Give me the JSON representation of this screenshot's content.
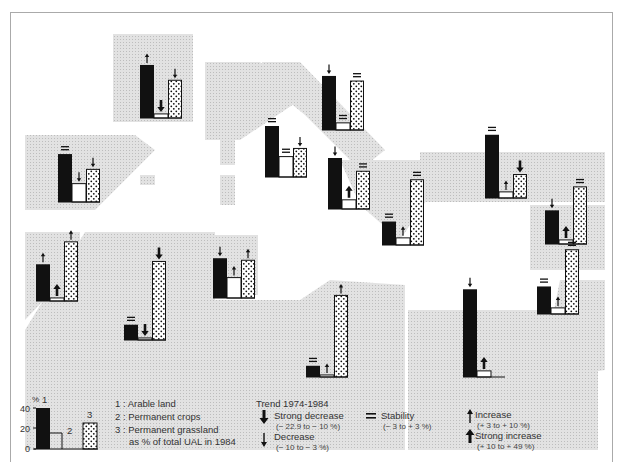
{
  "chart_data": {
    "type": "bar",
    "ylabel": "%",
    "ylim": [
      0,
      45
    ],
    "series_names": [
      "Arable land",
      "Permanent crops",
      "Permanent grassland"
    ],
    "groups": [
      {
        "x": 140,
        "base": 118,
        "values": [
          52,
          4,
          37
        ],
        "trends": [
          "increase",
          "strong-decrease",
          "decrease"
        ]
      },
      {
        "x": 58,
        "base": 202,
        "values": [
          47,
          18,
          32
        ],
        "trends": [
          "stability",
          "decrease",
          "decrease"
        ]
      },
      {
        "x": 265,
        "base": 177,
        "values": [
          50,
          20,
          28
        ],
        "trends": [
          "stability",
          "stability",
          "decrease"
        ]
      },
      {
        "x": 322,
        "base": 130,
        "values": [
          53,
          7,
          48
        ],
        "trends": [
          "decrease",
          "stability",
          "stability"
        ]
      },
      {
        "x": 328,
        "base": 209,
        "values": [
          50,
          9,
          37
        ],
        "trends": [
          "decrease",
          "strong-increase",
          "stability"
        ]
      },
      {
        "x": 382,
        "base": 245,
        "values": [
          23,
          7,
          64
        ],
        "trends": [
          "stability",
          "increase",
          "stability"
        ]
      },
      {
        "x": 485,
        "base": 198,
        "values": [
          62,
          6,
          23
        ],
        "trends": [
          "stability",
          "increase",
          "strong-decrease"
        ]
      },
      {
        "x": 545,
        "base": 244,
        "values": [
          33,
          4,
          56
        ],
        "trends": [
          "decrease",
          "strong-increase",
          "stability"
        ]
      },
      {
        "x": 537,
        "base": 314,
        "values": [
          27,
          6,
          63
        ],
        "trends": [
          "stability",
          "increase",
          "stability"
        ]
      },
      {
        "x": 36,
        "base": 301,
        "values": [
          36,
          3,
          58
        ],
        "trends": [
          "increase",
          "strong-increase",
          "increase"
        ]
      },
      {
        "x": 124,
        "base": 340,
        "values": [
          15,
          2,
          77
        ],
        "trends": [
          "stability",
          "strong-decrease",
          "strong-decrease"
        ]
      },
      {
        "x": 213,
        "base": 298,
        "values": [
          39,
          20,
          37
        ],
        "trends": [
          "decrease",
          "increase",
          "increase"
        ]
      },
      {
        "x": 306,
        "base": 377,
        "values": [
          11,
          2,
          80
        ],
        "trends": [
          "stability",
          "increase",
          "increase"
        ]
      },
      {
        "x": 463,
        "base": 377,
        "values": [
          86,
          6,
          0
        ],
        "trends": [
          "decrease",
          "strong-increase",
          "none"
        ]
      }
    ],
    "legend": {
      "series": [
        "1 : Arable land",
        "2 : Permanent crops",
        "3 : Permanent grassland as % of total UAL in 1984"
      ],
      "scale_ticks": [
        0,
        20,
        40
      ],
      "trend_title": "Trend 1974-1984"
    }
  },
  "legend": {
    "pct": "%",
    "tick_40": "40",
    "tick_20": "20",
    "tick_0": "0",
    "bar1": "1",
    "bar2": "2",
    "bar3": "3",
    "item1": "1 : Arable land",
    "item2": "2 : Permanent crops",
    "item3a": "3 : Permanent grassland",
    "item3b": "as % of total UAL in 1984",
    "trend_title": "Trend 1974-1984",
    "strong_decrease": "Strong decrease",
    "strong_decrease_range": "(− 22.9 to − 10 %)",
    "decrease": "Decrease",
    "decrease_range": "(− 10 to − 3 %)",
    "stability": "Stability",
    "stability_range": "(− 3 to + 3 %)",
    "increase": "Increase",
    "increase_range": "(+ 3 to + 10 %)",
    "strong_increase": "Strong increase",
    "strong_increase_range": "(+ 10 to + 49 %)"
  },
  "colors": {
    "land": "#dcdcdc",
    "bar_black": "#111111",
    "border": "#aaaaaa"
  }
}
